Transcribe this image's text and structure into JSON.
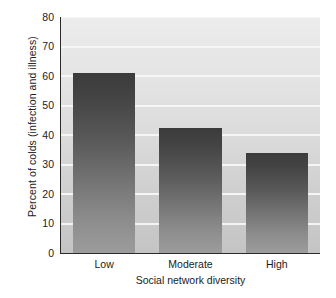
{
  "chart_data": {
    "type": "bar",
    "title": "",
    "subtitle": "",
    "xlabel": "Social network diversity",
    "ylabel": "Percent of colds (infection and illness)",
    "categories": [
      "Low",
      "Moderate",
      "High"
    ],
    "values": [
      61,
      42.5,
      34
    ],
    "ylim": [
      0,
      80
    ],
    "yticks": [
      0,
      10,
      20,
      30,
      40,
      50,
      60,
      70,
      80
    ],
    "ytick_labels": [
      "0",
      "10",
      "20",
      "30",
      "40",
      "50",
      "60",
      "70",
      "80"
    ],
    "grid": true,
    "grid_axis": "y",
    "legend": false,
    "legend_position": "none",
    "bar_fill": "#5a5a5a",
    "plot_background": "#dcdcdc",
    "gridline_color": "#f7f7f7",
    "axis_color": "#2b2b2b",
    "annotations": []
  }
}
